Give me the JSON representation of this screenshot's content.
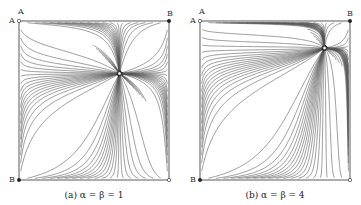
{
  "figure": {
    "panels": [
      {
        "id": "a",
        "caption": "(a) α = β = 1",
        "corner_labels": {
          "top_left_upper": "A",
          "top_left": "A",
          "top_right": "B",
          "bottom_left": "B"
        },
        "saddle_point": [
          0.67,
          0.67
        ]
      },
      {
        "id": "b",
        "caption": "(b) α = β = 4",
        "corner_labels": {
          "top_left_upper": "A",
          "top_left": "A",
          "top_right": "B",
          "bottom_left": "B"
        },
        "saddle_point": [
          0.83,
          0.83
        ]
      }
    ],
    "colors": {
      "stream": "#555555",
      "arrow": "#222222",
      "frame": "#333333"
    }
  }
}
